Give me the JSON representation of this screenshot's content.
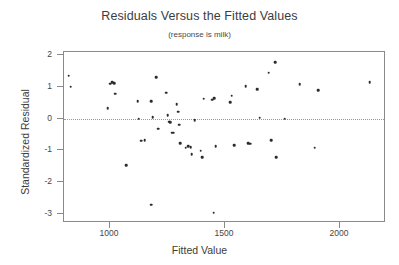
{
  "chart_data": {
    "type": "scatter",
    "title": "Residuals Versus the Fitted Values",
    "subtitle": "(response is milk)",
    "xlabel": "Fitted Value",
    "ylabel": "Standardized Residual",
    "xlim": [
      800,
      2200
    ],
    "ylim": [
      -3.3,
      2.1
    ],
    "xticks": [
      1000,
      1500,
      2000
    ],
    "yticks": [
      2,
      1,
      0,
      -1,
      -2,
      -3
    ],
    "grid": false,
    "legend": null,
    "reference_line": {
      "y": 0,
      "style": "dotted"
    },
    "point_color": "#2b2b2b",
    "frame_color": "#8a8a8a",
    "points": [
      {
        "x": 820,
        "y": 1.35
      },
      {
        "x": 830,
        "y": 1.0
      },
      {
        "x": 1000,
        "y": 1.1
      },
      {
        "x": 1010,
        "y": 1.15
      },
      {
        "x": 1018,
        "y": 1.12
      },
      {
        "x": 1022,
        "y": 0.78
      },
      {
        "x": 990,
        "y": 0.32
      },
      {
        "x": 1070,
        "y": -1.48
      },
      {
        "x": 1120,
        "y": 0.55
      },
      {
        "x": 1125,
        "y": 0.0
      },
      {
        "x": 1135,
        "y": -0.7
      },
      {
        "x": 1150,
        "y": -0.68
      },
      {
        "x": 1180,
        "y": 0.55
      },
      {
        "x": 1185,
        "y": 0.05
      },
      {
        "x": 1178,
        "y": -2.72
      },
      {
        "x": 1200,
        "y": 1.3
      },
      {
        "x": 1210,
        "y": -0.32
      },
      {
        "x": 1245,
        "y": 0.82
      },
      {
        "x": 1250,
        "y": 0.1
      },
      {
        "x": 1258,
        "y": -0.1
      },
      {
        "x": 1262,
        "y": -0.12
      },
      {
        "x": 1268,
        "y": -0.45
      },
      {
        "x": 1275,
        "y": -0.45
      },
      {
        "x": 1290,
        "y": 0.45
      },
      {
        "x": 1296,
        "y": 0.22
      },
      {
        "x": 1300,
        "y": -0.2
      },
      {
        "x": 1305,
        "y": -0.78
      },
      {
        "x": 1330,
        "y": -0.92
      },
      {
        "x": 1340,
        "y": -0.88
      },
      {
        "x": 1350,
        "y": -0.9
      },
      {
        "x": 1355,
        "y": -1.12
      },
      {
        "x": 1368,
        "y": -0.05
      },
      {
        "x": 1395,
        "y": -1.02
      },
      {
        "x": 1400,
        "y": -1.22
      },
      {
        "x": 1408,
        "y": 0.62
      },
      {
        "x": 1445,
        "y": 0.6
      },
      {
        "x": 1452,
        "y": 0.65
      },
      {
        "x": 1450,
        "y": -2.98
      },
      {
        "x": 1460,
        "y": -0.88
      },
      {
        "x": 1522,
        "y": 0.52
      },
      {
        "x": 1530,
        "y": 0.72
      },
      {
        "x": 1540,
        "y": -0.85
      },
      {
        "x": 1590,
        "y": 1.02
      },
      {
        "x": 1600,
        "y": -0.78
      },
      {
        "x": 1610,
        "y": -0.8
      },
      {
        "x": 1640,
        "y": 0.92
      },
      {
        "x": 1650,
        "y": 0.02
      },
      {
        "x": 1690,
        "y": 1.45
      },
      {
        "x": 1700,
        "y": -0.68
      },
      {
        "x": 1718,
        "y": 1.78
      },
      {
        "x": 1722,
        "y": -1.22
      },
      {
        "x": 1760,
        "y": 0.0
      },
      {
        "x": 1825,
        "y": 1.08
      },
      {
        "x": 1890,
        "y": -0.92
      },
      {
        "x": 1905,
        "y": 0.9
      },
      {
        "x": 2130,
        "y": 1.15
      }
    ]
  }
}
